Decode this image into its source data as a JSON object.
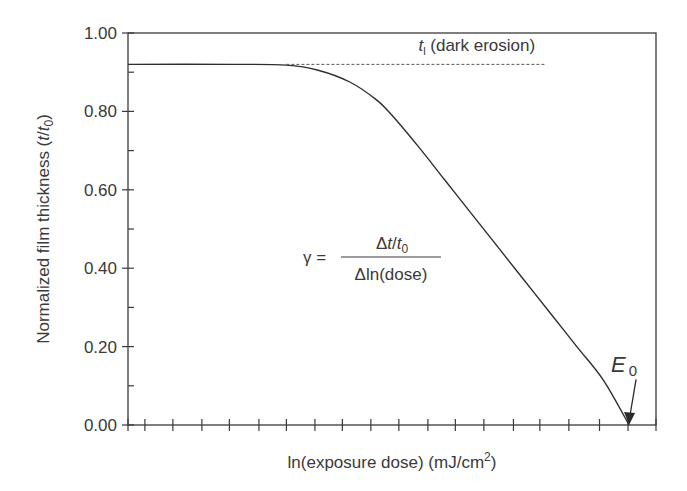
{
  "chart_data": {
    "type": "line",
    "title": "",
    "xlabel_main": "ln(exposure dose) (mJ/cm",
    "xlabel_sup": "2",
    "xlabel_close": ")",
    "ylabel_main": "Normalized film thickness (",
    "ylabel_t": "t",
    "ylabel_slash": "/",
    "ylabel_t0": "t",
    "ylabel_sub": "0",
    "ylabel_close": ")",
    "ylim": [
      0,
      1.0
    ],
    "xlim": [
      0,
      1.0
    ],
    "y_major_ticks": [
      0.0,
      0.2,
      0.4,
      0.6,
      0.8,
      1.0
    ],
    "y_tick_labels": [
      "0.00",
      "0.20",
      "0.40",
      "0.60",
      "0.80",
      "1.00"
    ],
    "y_minor_ticks": [
      0.1,
      0.3,
      0.5,
      0.7,
      0.9
    ],
    "x_ticks": [
      0.0,
      0.032,
      0.085,
      0.14,
      0.192,
      0.248,
      0.3,
      0.354,
      0.406,
      0.46,
      0.513,
      0.568,
      0.62,
      0.674,
      0.73,
      0.78,
      0.835,
      0.893,
      0.947,
      1.0
    ],
    "x_tick_labels_shown": false,
    "grid": false,
    "legend": "none",
    "series": [
      {
        "name": "contrast curve",
        "style": "solid",
        "x": [
          0.0,
          0.2,
          0.3,
          0.36,
          0.42,
          0.47,
          0.5,
          0.55,
          0.6,
          0.65,
          0.7,
          0.75,
          0.8,
          0.85,
          0.9,
          0.949
        ],
        "y": [
          0.92,
          0.92,
          0.918,
          0.905,
          0.875,
          0.83,
          0.79,
          0.71,
          0.625,
          0.54,
          0.455,
          0.37,
          0.285,
          0.2,
          0.115,
          0.0
        ]
      },
      {
        "name": "dark erosion extrapolation",
        "style": "dashed",
        "x": [
          0.3,
          0.79
        ],
        "y": [
          0.92,
          0.92
        ]
      }
    ],
    "annotations": [
      {
        "id": "dark-erosion",
        "symbol": "t",
        "subscript": "l",
        "text": " (dark erosion)",
        "x": 0.55,
        "y": 0.955
      },
      {
        "id": "gamma-formula",
        "lhs": "γ =",
        "numerator_delta": "Δ",
        "numerator_t": "t",
        "numerator_slash": "/",
        "numerator_t0": "t",
        "numerator_sub": "0",
        "denominator": "Δln(dose)",
        "x": 0.36,
        "y": 0.44
      },
      {
        "id": "E0",
        "symbol": "E",
        "subscript": "0",
        "arrow_to_x": 0.949,
        "arrow_to_y": 0.0,
        "x": 0.915,
        "y": 0.18
      }
    ]
  },
  "colors": {
    "ink": "#3a3a3a",
    "background": "#ffffff"
  }
}
